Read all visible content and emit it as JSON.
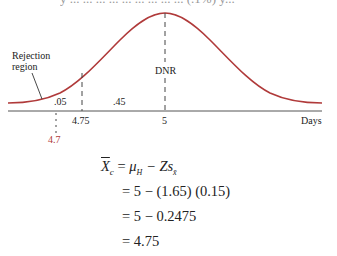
{
  "figure": {
    "clipped_top_text": "y ... ... ... ... ... ... ... ... ... (.1%) y...",
    "rejection_label_line1": "Rejection",
    "rejection_label_line2": "region",
    "dnr_label": "DNR",
    "area_left": ".05",
    "area_middle": ".45",
    "x_axis_label": "Days",
    "tick_4_75": "4.75",
    "tick_5": "5",
    "tick_4_7": "4.7",
    "curve_color": "#b03a3a",
    "highlight_color": "#b03a3a"
  },
  "equation": {
    "line1_lhs": "X",
    "line1_sub": "c",
    "line1_rhs_mu": "μ",
    "line1_rhs_mu_sub": "H",
    "line1_rhs_rest": " − Zs",
    "line1_rhs_s_sub": "x̄",
    "line2": "= 5 − (1.65) (0.15)",
    "line3": "= 5 − 0.2475",
    "line4": "= 4.75"
  }
}
